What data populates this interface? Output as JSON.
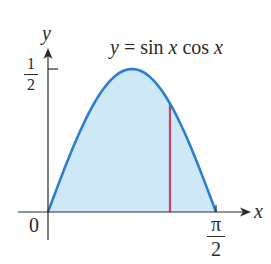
{
  "figure": {
    "function_label": "y = sin x cos x",
    "function_label_parts": {
      "lhs": "y",
      "eq": "=",
      "rhs_sin": "sin",
      "rhs_x1": "x",
      "rhs_cos": "cos",
      "rhs_x2": "x"
    },
    "x_axis_label": "x",
    "y_axis_label": "y",
    "origin_label": "0",
    "y_tick": {
      "numerator": "1",
      "denominator": "2",
      "value": 0.5
    },
    "x_tick": {
      "numerator": "π",
      "denominator": "2",
      "value": 1.5708
    },
    "highlight_line_x_fraction": 0.726,
    "colors": {
      "curve": "#2a7fd0",
      "fill": "#cfe8f7",
      "axis": "#2a2a2a",
      "highlight_line": "#c8436a"
    }
  },
  "chart_data": {
    "type": "area",
    "title": "",
    "xlabel": "x",
    "ylabel": "y",
    "function": "sin(x)cos(x)",
    "x_range": [
      0,
      1.5708
    ],
    "ylim": [
      0,
      0.5
    ],
    "x_ticks": [
      "0",
      "π/2"
    ],
    "y_ticks": [
      "1/2"
    ],
    "annotation": "y = sin x cos x",
    "shaded_region": "area under curve from 0 to π/2",
    "vertical_segment_x": 1.14
  }
}
